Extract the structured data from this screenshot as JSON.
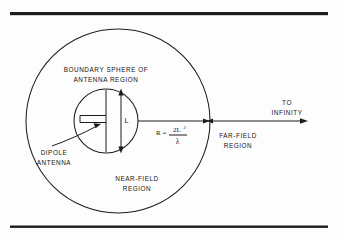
{
  "figure": {
    "background_color": "#fdfdfd",
    "ink_color": "#1c1c1c"
  },
  "rules": {
    "top_rule_label": "top-horizontal-rule",
    "bottom_rule_label": "bottom-horizontal-rule"
  },
  "labels": {
    "boundary_line1": "BOUNDARY  SPHERE  OF",
    "boundary_line2": "ANTENNA   REGION",
    "dipole_line1": "DIPOLE",
    "dipole_line2": "ANTENNA",
    "near_field_line1": "NEAR-FIELD",
    "near_field_line2": "REGION",
    "far_field_line1": "FAR-FIELD",
    "far_field_line2": "REGION",
    "to_infinity_line1": "TO",
    "to_infinity_line2": "INFINITY",
    "length_symbol": "L"
  },
  "formula": {
    "lhs": "R",
    "equals": "=",
    "numerator": "2L",
    "numerator_exponent": "2",
    "denominator": "λ",
    "plain": "R = 2L² / λ"
  },
  "geometry": {
    "outer_circle": {
      "cx": 118,
      "cy": 121,
      "r": 92,
      "name": "far-field-boundary-circle"
    },
    "inner_circle": {
      "cx": 106,
      "cy": 121,
      "r": 32,
      "name": "antenna-region-boundary-circle"
    },
    "dipole_length_L": 64,
    "radius_R_label": "R"
  }
}
